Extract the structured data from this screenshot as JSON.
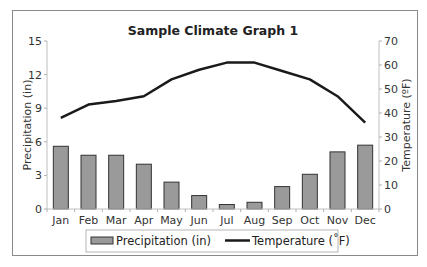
{
  "chart_data": {
    "type": "bar+line",
    "title": "Sample Climate Graph 1",
    "categories": [
      "Jan",
      "Feb",
      "Mar",
      "Apr",
      "May",
      "Jun",
      "Jul",
      "Aug",
      "Sep",
      "Oct",
      "Nov",
      "Dec"
    ],
    "series": [
      {
        "name": "Precipitation (in)",
        "type": "bar",
        "axis": "left",
        "color": "#9a9a9a",
        "border": "#333333",
        "values": [
          5.6,
          4.8,
          4.8,
          4.0,
          2.4,
          1.2,
          0.4,
          0.6,
          2.0,
          3.1,
          5.1,
          5.7
        ]
      },
      {
        "name": "Temperature (˚F)",
        "type": "line",
        "axis": "right",
        "color": "#1a1a1a",
        "values": [
          38,
          43.5,
          45,
          47,
          54,
          58,
          61,
          61,
          57.5,
          54,
          47,
          36
        ]
      }
    ],
    "ylabel_left": "Precipitation (in)",
    "ylabel_right": "Temperature (ºF)",
    "ylim_left": [
      0,
      15
    ],
    "yticks_left": [
      "0",
      "3",
      "6",
      "9",
      "12",
      "15"
    ],
    "ylim_right": [
      0,
      70
    ],
    "yticks_right": [
      "0",
      "10",
      "20",
      "30",
      "40",
      "50",
      "60",
      "70"
    ],
    "grid": false,
    "legend_position": "bottom",
    "legend": [
      "Precipitation (in)",
      "Temperature (˚F)"
    ]
  }
}
